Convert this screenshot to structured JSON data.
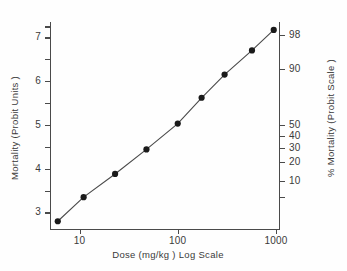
{
  "chart_data": {
    "type": "scatter",
    "title": "",
    "xlabel": "Dose  (mg/kg )  Log Scale",
    "ylabel": "Mortality  (Probit Units )",
    "y2label": "% Mortality  (Probit Scale )",
    "xscale": "log",
    "xlim": [
      5,
      1100
    ],
    "ylim": [
      2.6,
      7.35
    ],
    "grid": false,
    "legend": null,
    "x": [
      6,
      11,
      23,
      48,
      100,
      175,
      300,
      570,
      950
    ],
    "y": [
      2.8,
      3.35,
      3.88,
      4.44,
      5.03,
      5.62,
      6.15,
      6.7,
      7.17
    ],
    "percent_mortality": [
      1.4,
      5,
      13,
      29,
      51,
      73,
      87,
      96,
      98.5
    ],
    "series": [
      {
        "name": "mortality",
        "points": [
          {
            "dose": 6,
            "probit": 2.8
          },
          {
            "dose": 11,
            "probit": 3.35
          },
          {
            "dose": 23,
            "probit": 3.88
          },
          {
            "dose": 48,
            "probit": 4.44
          },
          {
            "dose": 100,
            "probit": 5.03
          },
          {
            "dose": 175,
            "probit": 5.62
          },
          {
            "dose": 300,
            "probit": 6.15
          },
          {
            "dose": 570,
            "probit": 6.7
          },
          {
            "dose": 950,
            "probit": 7.17
          }
        ]
      }
    ],
    "xticks": [
      {
        "value": 10,
        "label": "10"
      },
      {
        "value": 100,
        "label": "100"
      },
      {
        "value": 1000,
        "label": "1000"
      }
    ],
    "yticks_left": [
      {
        "value": 3,
        "label": "3"
      },
      {
        "value": 3.5,
        "label": ""
      },
      {
        "value": 4,
        "label": "4"
      },
      {
        "value": 4.5,
        "label": ""
      },
      {
        "value": 5,
        "label": "5"
      },
      {
        "value": 5.5,
        "label": ""
      },
      {
        "value": 6,
        "label": "6"
      },
      {
        "value": 6.5,
        "label": ""
      },
      {
        "value": 7,
        "label": "7"
      },
      {
        "value": 7.25,
        "label": ""
      }
    ],
    "yticks_right": [
      {
        "probit": 7.05,
        "label": "98"
      },
      {
        "probit": 6.28,
        "label": "90"
      },
      {
        "probit": 5.0,
        "label": "50"
      },
      {
        "probit": 4.75,
        "label": "40"
      },
      {
        "probit": 4.48,
        "label": "30"
      },
      {
        "probit": 4.16,
        "label": "20"
      },
      {
        "probit": 3.72,
        "label": "10"
      },
      {
        "probit": 3.35,
        "label": ""
      }
    ]
  },
  "colors": {
    "axis": "#4a4a4a",
    "marker": "#1a1a1a",
    "line": "#4a4a4a",
    "text": "#3a3a3a",
    "background": "#fefefe"
  }
}
